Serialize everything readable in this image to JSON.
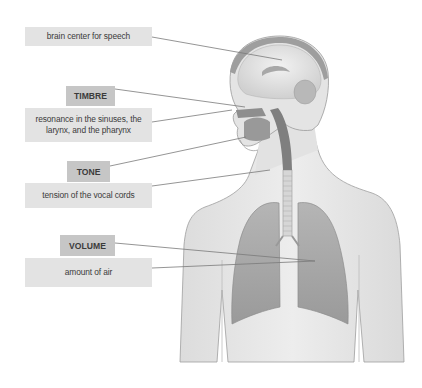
{
  "diagram": {
    "colors": {
      "header_box": "#c6c6c6",
      "description_box": "#e3e3e3",
      "text": "#3b3b3b",
      "leader_line": "#7a7a7a",
      "body_fill": "#e8e8e8",
      "lung_fill": "#a9a9a9"
    },
    "labels": [
      {
        "id": "brain",
        "heading": null,
        "description": "brain center for speech"
      },
      {
        "id": "timbre",
        "heading": "TIMBRE",
        "description": "resonance in the sinuses, the larynx, and the pharynx"
      },
      {
        "id": "tone",
        "heading": "TONE",
        "description": "tension of the vocal cords"
      },
      {
        "id": "volume",
        "heading": "VOLUME",
        "description": "amount of air"
      }
    ]
  }
}
